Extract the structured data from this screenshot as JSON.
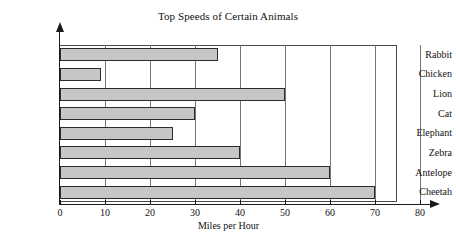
{
  "chart_data": {
    "type": "bar",
    "orientation": "horizontal",
    "title": "Top Speeds of Certain Animals",
    "xlabel": "Miles per Hour",
    "ylabel": "",
    "categories": [
      "Rabbit",
      "Chicken",
      "Lion",
      "Cat",
      "Elephant",
      "Zebra",
      "Antelope",
      "Cheetah"
    ],
    "values": [
      35,
      9,
      50,
      30,
      25,
      40,
      60,
      70
    ],
    "xlim": [
      0,
      80
    ],
    "xticks": [
      0,
      10,
      20,
      30,
      40,
      50,
      60,
      70,
      80
    ],
    "xtick_labels": [
      "0",
      "10",
      "20",
      "30",
      "40",
      "50",
      "60",
      "70",
      "80"
    ],
    "grid": "vertical",
    "legend": "none",
    "bar_fill_color": "#c6c6c6",
    "bar_edge_color": "#2b2b2b",
    "axis_color": "#1a1a1a",
    "gridline_color": "#777777",
    "background_color": "#ffffff"
  }
}
